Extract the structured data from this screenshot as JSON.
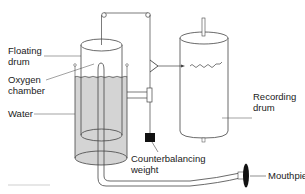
{
  "diagram": {
    "labels": {
      "floating_drum": [
        "Floating",
        "drum"
      ],
      "oxygen_chamber": [
        "Oxygen",
        "chamber"
      ],
      "water": "Water",
      "recording_drum": [
        "Recording",
        "drum"
      ],
      "counterbalancing_weight": [
        "Counterbalancing",
        "weight"
      ],
      "mouthpiece": "Mouthpiece"
    },
    "colors": {
      "line": "#333333",
      "water_fill": "#d4d4d4",
      "weight_fill": "#111111",
      "background": "#ffffff"
    }
  }
}
